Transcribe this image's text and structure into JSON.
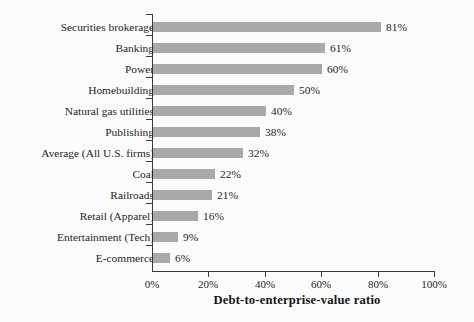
{
  "chart_data": {
    "type": "bar",
    "orientation": "horizontal",
    "title": "",
    "xlabel": "Debt-to-enterprise-value ratio",
    "ylabel": "",
    "xlim": [
      0,
      100
    ],
    "grid": false,
    "legend": null,
    "xtick_labels": [
      "0%",
      "20%",
      "40%",
      "60%",
      "80%",
      "100%"
    ],
    "xtick_values": [
      0,
      20,
      40,
      60,
      80,
      100
    ],
    "bar_color": "#a9a9a9",
    "axis_color": "#3a3a3a",
    "background": "#fbfbfb",
    "categories": [
      "Securities brokerage",
      "Banking",
      "Power",
      "Homebuilding",
      "Natural gas utilities",
      "Publishing",
      "Average (All U.S. firms)",
      "Coal",
      "Railroads",
      "Retail (Apparel)",
      "Entertainment (Tech)",
      "E-commerce"
    ],
    "values": [
      81,
      61,
      60,
      50,
      40,
      38,
      32,
      22,
      21,
      16,
      9,
      6
    ],
    "value_labels": [
      "81%",
      "61%",
      "60%",
      "50%",
      "40%",
      "38%",
      "32%",
      "22%",
      "21%",
      "16%",
      "9%",
      "6%"
    ]
  }
}
